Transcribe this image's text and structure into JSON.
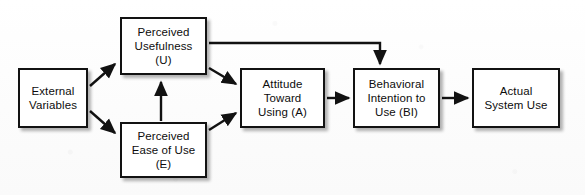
{
  "diagram": {
    "type": "flow-diagram",
    "background_color": "#fdfdfd",
    "stroke_color": "#121212",
    "box_fill": "#ffffff",
    "nodes": [
      {
        "id": "external-variables",
        "label": "External\nVariables",
        "x": 18,
        "y": 68,
        "w": 70,
        "h": 60
      },
      {
        "id": "perceived-usefulness",
        "label": "Perceived\nUsefulness\n(U)",
        "x": 120,
        "y": 17,
        "w": 87,
        "h": 58
      },
      {
        "id": "perceived-ease-of-use",
        "label": "Perceived\nEase of Use\n(E)",
        "x": 120,
        "y": 122,
        "w": 87,
        "h": 56
      },
      {
        "id": "attitude-toward-using",
        "label": "Attitude\nToward\nUsing (A)",
        "x": 240,
        "y": 68,
        "w": 85,
        "h": 60
      },
      {
        "id": "behavioral-intention",
        "label": "Behavioral\nIntention to\nUse (BI)",
        "x": 353,
        "y": 68,
        "w": 87,
        "h": 60
      },
      {
        "id": "actual-system-use",
        "label": "Actual\nSystem Use",
        "x": 472,
        "y": 68,
        "w": 88,
        "h": 60
      }
    ],
    "edges": [
      {
        "id": "external-to-usefulness",
        "from": "external-variables",
        "to": "perceived-usefulness"
      },
      {
        "id": "external-to-ease",
        "from": "external-variables",
        "to": "perceived-ease-of-use"
      },
      {
        "id": "ease-to-usefulness",
        "from": "perceived-ease-of-use",
        "to": "perceived-usefulness"
      },
      {
        "id": "usefulness-to-attitude",
        "from": "perceived-usefulness",
        "to": "attitude-toward-using"
      },
      {
        "id": "ease-to-attitude",
        "from": "perceived-ease-of-use",
        "to": "attitude-toward-using"
      },
      {
        "id": "usefulness-to-intention",
        "from": "perceived-usefulness",
        "to": "behavioral-intention"
      },
      {
        "id": "attitude-to-intention",
        "from": "attitude-toward-using",
        "to": "behavioral-intention"
      },
      {
        "id": "intention-to-actual-use",
        "from": "behavioral-intention",
        "to": "actual-system-use"
      }
    ]
  }
}
